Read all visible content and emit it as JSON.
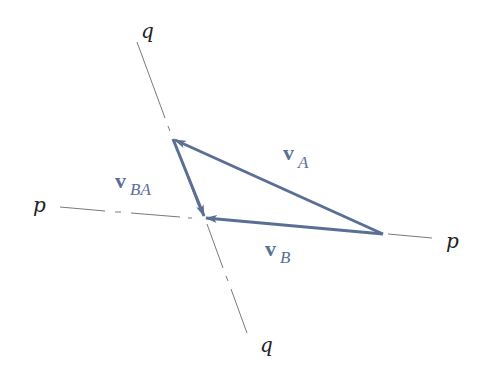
{
  "diagram": {
    "type": "vector triangle (relative velocity)",
    "colors": {
      "vector": "#5a6f96",
      "axis_line": "#7a7a7a",
      "label_text": "#222222",
      "vector_label": "#5a6f96"
    },
    "axes": {
      "p": {
        "label_left": "p",
        "label_right": "p"
      },
      "q": {
        "label_top": "q",
        "label_bottom": "q"
      }
    },
    "vectors": [
      {
        "id": "vA",
        "symbol": "v",
        "subscript": "A",
        "description": "from right point to top point"
      },
      {
        "id": "vB",
        "symbol": "v",
        "subscript": "B",
        "description": "from right point to intersection of p and q"
      },
      {
        "id": "vBA",
        "symbol": "v",
        "subscript": "BA",
        "description": "from top point to intersection of p and q"
      }
    ]
  }
}
